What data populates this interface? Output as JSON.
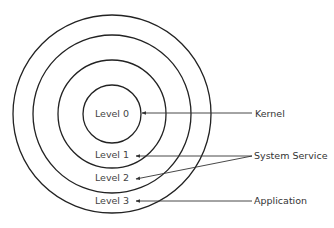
{
  "diagram": {
    "type": "concentric-rings",
    "levels": [
      {
        "label": "Level 0"
      },
      {
        "label": "Level 1"
      },
      {
        "label": "Level 2"
      },
      {
        "label": "Level 3"
      }
    ],
    "annotations": [
      {
        "label": "Kernel",
        "points_to": [
          "Level 0"
        ]
      },
      {
        "label": "System Service",
        "points_to": [
          "Level 1",
          "Level 2"
        ]
      },
      {
        "label": "Application",
        "points_to": [
          "Level 3"
        ]
      }
    ]
  }
}
